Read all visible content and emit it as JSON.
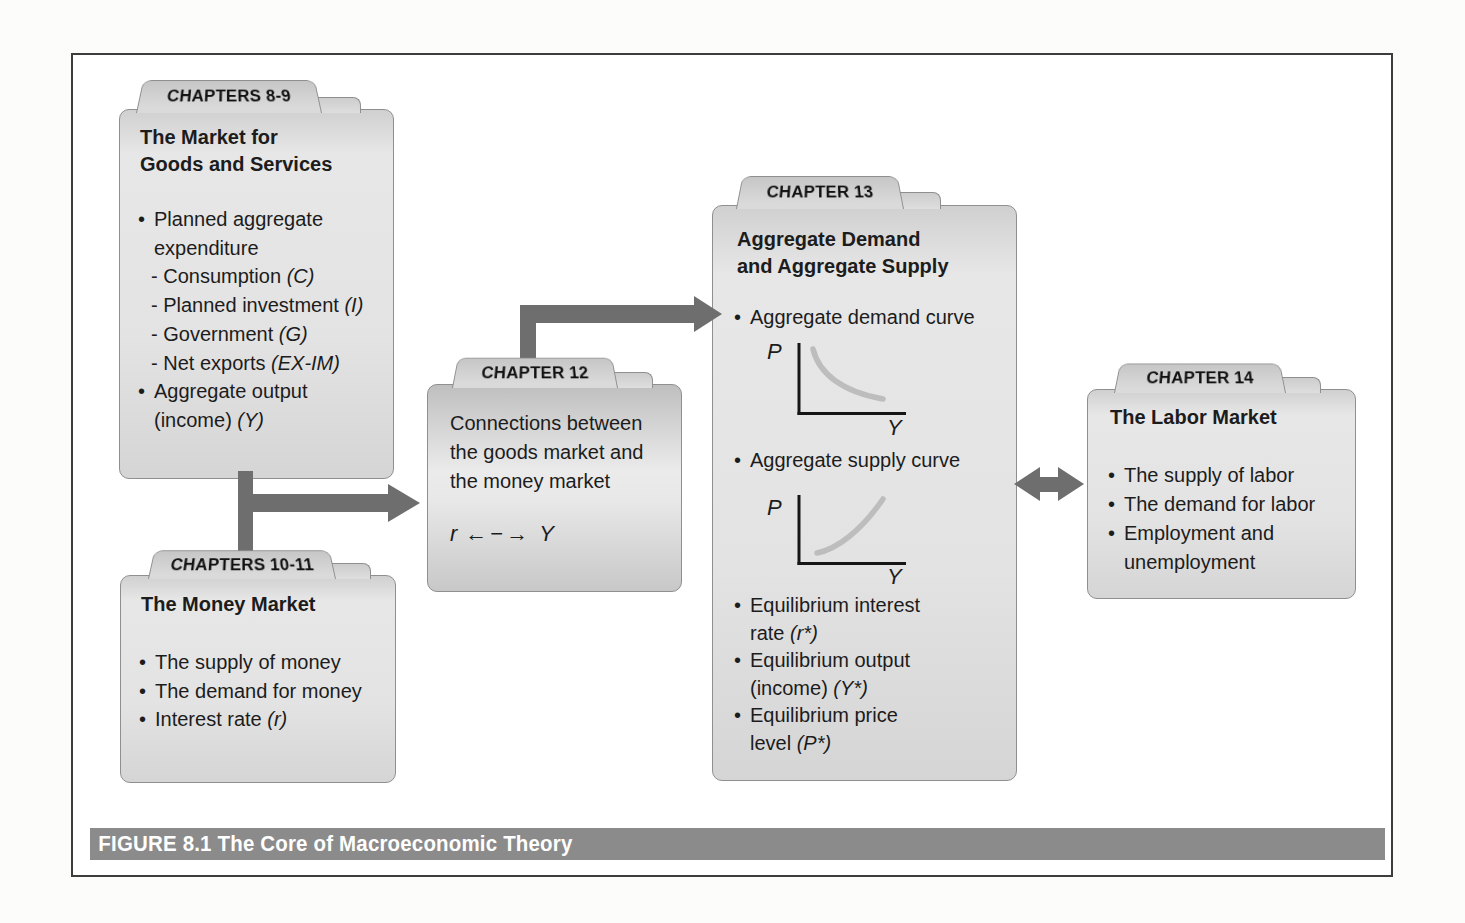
{
  "glyphs": {
    "bullet": "•"
  },
  "figure": {
    "caption": "FIGURE 8.1 The Core of Macroeconomic Theory"
  },
  "colors": {
    "arrow": "#6e6e6e",
    "caption_bar": "#8b8b8b",
    "curve": "#bdbdbd",
    "card_fill": "#e3e3e3"
  },
  "boxes": {
    "goods": {
      "tab": "CHAPTERS 8-9",
      "title1": "The Market for",
      "title2": "Goods and Services",
      "l1": {
        "t": "Planned aggregate"
      },
      "l2": {
        "t": "expenditure"
      },
      "l3": {
        "t": "- Consumption ",
        "i": "(C)"
      },
      "l4": {
        "t": "- Planned investment ",
        "i": "(I)"
      },
      "l5": {
        "t": "- Government ",
        "i": "(G)"
      },
      "l6": {
        "t": "- Net exports ",
        "i": "(EX-IM)"
      },
      "l7": {
        "t": "Aggregate output"
      },
      "l8": {
        "t": "(income) ",
        "i": "(Y)"
      }
    },
    "money": {
      "tab": "CHAPTERS 10-11",
      "title1": "The Money Market",
      "l1": {
        "t": "The supply of money"
      },
      "l2": {
        "t": "The demand for money"
      },
      "l3": {
        "t": "Interest rate ",
        "i": "(r)"
      }
    },
    "connections": {
      "tab": "CHAPTER 12",
      "l1": "Connections between",
      "l2": "the goods market and",
      "l3": "the money market",
      "formula": {
        "r": "r",
        "arrows": "←−→",
        "y": "Y"
      }
    },
    "adas": {
      "tab": "CHAPTER 13",
      "title1": "Aggregate Demand",
      "title2": "and Aggregate Supply",
      "b1": "Aggregate demand curve",
      "b2": "Aggregate supply curve",
      "chart_p": "P",
      "chart_y": "Y",
      "e1a": "Equilibrium interest",
      "e1b": {
        "t": "rate ",
        "i": "(r*)"
      },
      "e2a": "Equilibrium output",
      "e2b": {
        "t": "(income) ",
        "i": "(Y*)"
      },
      "e3a": "Equilibrium price",
      "e3b": {
        "t": "level ",
        "i": "(P*)"
      }
    },
    "labor": {
      "tab": "CHAPTER 14",
      "title1": "The Labor Market",
      "l1": "The supply of labor",
      "l2": "The demand for labor",
      "l3a": "Employment and",
      "l3b": "unemployment"
    }
  }
}
